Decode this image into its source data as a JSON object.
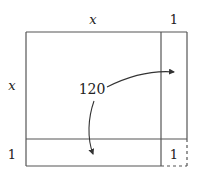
{
  "diagram": {
    "top_labels": {
      "x": "x",
      "one": "1"
    },
    "left_labels": {
      "x": "x",
      "one": "1"
    },
    "center_label": "120",
    "corner_cell_label": "1",
    "colors": {
      "stroke": "#333333",
      "text": "#222222",
      "background": "#ffffff"
    }
  }
}
